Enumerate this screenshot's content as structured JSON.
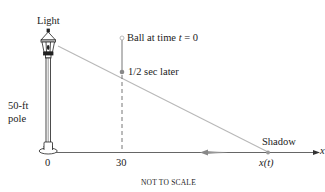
{
  "labels": {
    "light": "Light",
    "pole_line1": "50-ft",
    "pole_line2": "pole",
    "ball_start": "Ball at time ",
    "ball_t": "t",
    "ball_eq": " = 0",
    "ball_later": "1/2 sec later",
    "origin": "0",
    "ball_position": "30",
    "shadow": "Shadow",
    "shadow_position": "x(t)",
    "axis": "x",
    "footnote": "NOT TO SCALE"
  },
  "geometry": {
    "pole_height_ft": 50,
    "ball_x_ft": 30,
    "ball_initial_time": 0,
    "ball_later_time_sec": 0.5
  },
  "colors": {
    "ink": "#222222",
    "ray": "#b5b5b5",
    "ball_line": "#777777",
    "ground": "#555555"
  }
}
